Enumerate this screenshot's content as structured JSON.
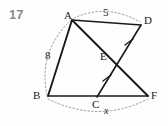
{
  "figure": {
    "problem_number": "17",
    "type": "geometry-diagram",
    "background_color": "#fefefe",
    "line_color": "#1a1a1a",
    "arc_color": "#999999",
    "number_color": "#8c8c8c"
  },
  "vertices": [
    {
      "name": "A",
      "label": "A",
      "x": 72,
      "y": 20,
      "label_x": 64,
      "label_y": 10
    },
    {
      "name": "D",
      "label": "D",
      "x": 141,
      "y": 25,
      "label_x": 144,
      "label_y": 15
    },
    {
      "name": "E",
      "label": "E",
      "x": 118,
      "y": 60,
      "label_x": 100,
      "label_y": 51
    },
    {
      "name": "B",
      "label": "B",
      "x": 48,
      "y": 96,
      "label_x": 33,
      "label_y": 90
    },
    {
      "name": "C",
      "label": "C",
      "x": 97,
      "y": 97,
      "label_x": 92,
      "label_y": 99
    },
    {
      "name": "F",
      "label": "F",
      "x": 148,
      "y": 96,
      "label_x": 151,
      "label_y": 90
    }
  ],
  "segments": [
    {
      "name": "segment-AD",
      "from": "A",
      "to": "D"
    },
    {
      "name": "segment-AB",
      "from": "A",
      "to": "B"
    },
    {
      "name": "segment-AF",
      "from": "A",
      "to": "F"
    },
    {
      "name": "segment-CD",
      "from": "C",
      "to": "D"
    },
    {
      "name": "segment-BF",
      "from": "B",
      "to": "F"
    }
  ],
  "measurements": [
    {
      "name": "measure-AD",
      "value": "5",
      "label_x": 103,
      "label_y": 7,
      "between": "A-D",
      "style": "dotted-arc"
    },
    {
      "name": "measure-AB",
      "value": "8",
      "label_x": 45,
      "label_y": 50,
      "between": "A-B",
      "style": "dotted-arc"
    },
    {
      "name": "measure-BF",
      "value": "x",
      "label_x": 104,
      "label_y": 106,
      "between": "B-F",
      "style": "dotted-arc",
      "italic": true
    }
  ],
  "tick_marks": [
    {
      "name": "tick-ED",
      "on_segment": "C-D",
      "x": 129,
      "y": 42
    },
    {
      "name": "tick-CE",
      "on_segment": "C-D",
      "x": 107,
      "y": 78
    }
  ]
}
